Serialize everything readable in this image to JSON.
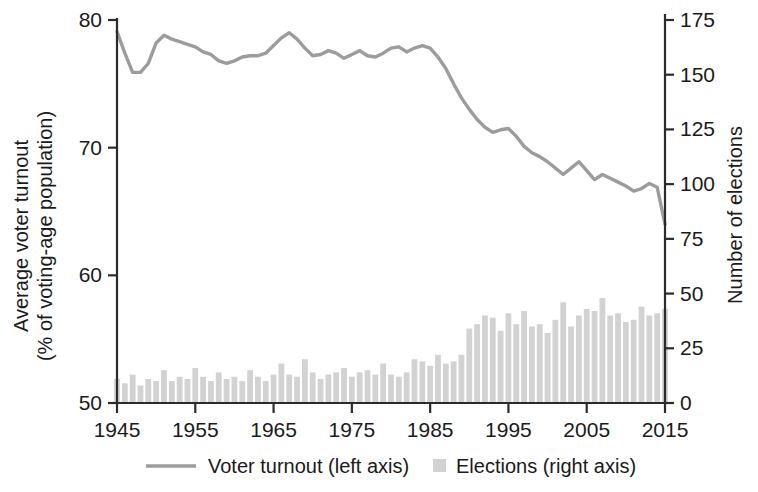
{
  "chart_data": {
    "type": "line",
    "title": "",
    "xlabel": "",
    "ylabel": "Average voter turnout\n(% of voting-age population)",
    "ylabel_line1": "Average voter turnout",
    "ylabel_line2": "(% of voting-age population)",
    "y2label": "Number of elections",
    "grid": false,
    "legend_position": "bottom",
    "xlim": [
      1945,
      2015
    ],
    "ylim": [
      50,
      80
    ],
    "y2lim": [
      0,
      175
    ],
    "xticks": [
      1945,
      1955,
      1965,
      1975,
      1985,
      1995,
      2005,
      2015
    ],
    "xticklabels": [
      "1945",
      "1955",
      "1965",
      "1975",
      "1985",
      "1995",
      "2005",
      "2015"
    ],
    "yticks": [
      50,
      60,
      70,
      80
    ],
    "yticklabels": [
      "50",
      "60",
      "70",
      "80"
    ],
    "y2ticks": [
      0,
      25,
      50,
      75,
      100,
      125,
      150,
      175
    ],
    "y2ticklabels": [
      "0",
      "25",
      "50",
      "75",
      "100",
      "125",
      "150",
      "175"
    ],
    "legend": [
      {
        "name": "Voter turnout (left axis)",
        "marker": "line",
        "color": "#9c9c9c"
      },
      {
        "name": "Elections (right axis)",
        "marker": "square",
        "color": "#d2d2d2"
      }
    ],
    "x": [
      1945,
      1946,
      1947,
      1948,
      1949,
      1950,
      1951,
      1952,
      1953,
      1954,
      1955,
      1956,
      1957,
      1958,
      1959,
      1960,
      1961,
      1962,
      1963,
      1964,
      1965,
      1966,
      1967,
      1968,
      1969,
      1970,
      1971,
      1972,
      1973,
      1974,
      1975,
      1976,
      1977,
      1978,
      1979,
      1980,
      1981,
      1982,
      1983,
      1984,
      1985,
      1986,
      1987,
      1988,
      1989,
      1990,
      1991,
      1992,
      1993,
      1994,
      1995,
      1996,
      1997,
      1998,
      1999,
      2000,
      2001,
      2002,
      2003,
      2004,
      2005,
      2006,
      2007,
      2008,
      2009,
      2010,
      2011,
      2012,
      2013,
      2014,
      2015
    ],
    "series": [
      {
        "name": "Voter turnout (left axis)",
        "axis": "left",
        "color": "#9c9c9c",
        "units": "% of voting-age population",
        "values": [
          79.1,
          77.4,
          75.9,
          75.9,
          76.6,
          78.2,
          78.8,
          78.5,
          78.3,
          78.1,
          77.9,
          77.5,
          77.3,
          76.8,
          76.6,
          76.8,
          77.1,
          77.2,
          77.2,
          77.4,
          78.0,
          78.6,
          79.0,
          78.5,
          77.8,
          77.2,
          77.3,
          77.6,
          77.4,
          77.0,
          77.3,
          77.6,
          77.2,
          77.1,
          77.4,
          77.8,
          77.9,
          77.5,
          77.8,
          78.0,
          77.8,
          77.1,
          76.2,
          75.0,
          73.9,
          73.0,
          72.2,
          71.6,
          71.2,
          71.4,
          71.5,
          70.9,
          70.1,
          69.6,
          69.3,
          68.9,
          68.4,
          67.9,
          68.4,
          68.9,
          68.2,
          67.5,
          67.9,
          67.6,
          67.3,
          67.0,
          66.6,
          66.8,
          67.2,
          66.9,
          64.0
        ]
      },
      {
        "name": "Elections (right axis)",
        "axis": "right",
        "color": "#d2d2d2",
        "units": "number of elections",
        "values": [
          11,
          9,
          13,
          8,
          11,
          10,
          15,
          10,
          12,
          11,
          16,
          12,
          10,
          14,
          11,
          12,
          10,
          15,
          12,
          10,
          13,
          18,
          13,
          12,
          20,
          14,
          11,
          13,
          14,
          16,
          12,
          14,
          15,
          13,
          18,
          13,
          12,
          14,
          20,
          19,
          17,
          22,
          18,
          19,
          22,
          34,
          36,
          40,
          39,
          33,
          41,
          36,
          42,
          35,
          36,
          32,
          38,
          46,
          35,
          40,
          43,
          42,
          48,
          40,
          41,
          37,
          38,
          44,
          40,
          41,
          43
        ]
      }
    ]
  }
}
